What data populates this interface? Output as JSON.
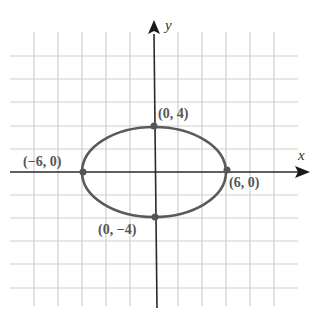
{
  "chart_data": {
    "type": "scatter",
    "subtype": "conic-ellipse",
    "title": "",
    "xlabel": "x",
    "ylabel": "y",
    "grid": true,
    "grid_step": 2,
    "xlim": [
      -12,
      12
    ],
    "ylim": [
      -10,
      12
    ],
    "curve": {
      "shape": "ellipse",
      "center": [
        0,
        0
      ],
      "semi_major_x": 6,
      "semi_minor_y": 4,
      "equation": "x^2/36 + y^2/16 = 1",
      "color": "#555555"
    },
    "points": [
      {
        "x": 0,
        "y": 4,
        "label": "(0, 4)"
      },
      {
        "x": -6,
        "y": 0,
        "label": "(−6, 0)"
      },
      {
        "x": 6,
        "y": 0,
        "label": "(6, 0)"
      },
      {
        "x": 0,
        "y": -4,
        "label": "(0, −4)"
      }
    ]
  },
  "axes": {
    "x_label": "x",
    "y_label": "y"
  },
  "labels": {
    "top": "(0, 4)",
    "left": "(−6, 0)",
    "right": "(6, 0)",
    "bottom": "(0, −4)"
  },
  "colors": {
    "grid": "#cfcfcf",
    "axis": "#2a2a2a",
    "curve": "#5a5a5a",
    "point": "#555555",
    "label": "#555555"
  }
}
